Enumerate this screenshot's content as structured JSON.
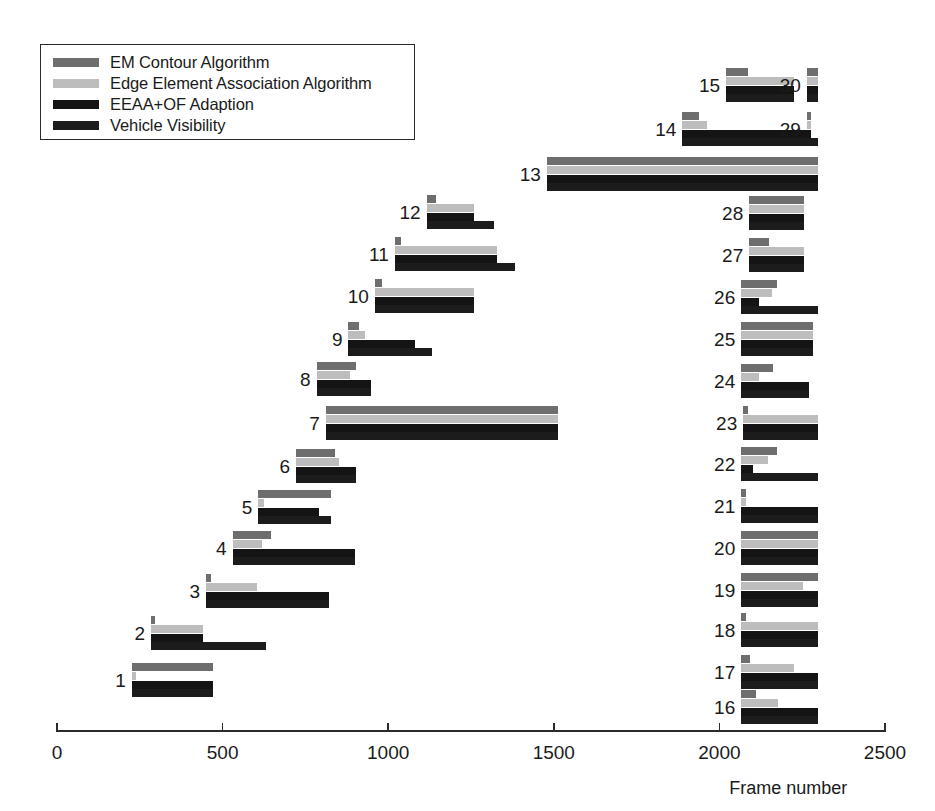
{
  "legend": {
    "items": [
      {
        "label": "EM Contour Algorithm",
        "color": "#6e6e6e"
      },
      {
        "label": "Edge Element Association Algorithm",
        "color": "#bdbdbd"
      },
      {
        "label": "EEAA+OF Adaption",
        "color": "#141414"
      },
      {
        "label": "Vehicle Visibility",
        "color": "#1c1c1c"
      }
    ]
  },
  "axis": {
    "label": "Frame number",
    "ticks": [
      0,
      500,
      1000,
      1500,
      2000,
      2500
    ],
    "tick_labels": [
      "0",
      "500",
      "1000",
      "1500",
      "2000",
      "2500"
    ],
    "min": 0,
    "max": 2500
  },
  "chart_data": {
    "type": "bar",
    "orientation": "horizontal",
    "title": "",
    "xlabel": "Frame number",
    "ylabel": "",
    "xlim": [
      0,
      2500
    ],
    "grid": false,
    "legend_position": "top-left",
    "note": "Gantt-style chart: each numbered track shows 4 stacked interval bars sharing a common start frame, one per algorithm series.",
    "series_names": [
      "EM Contour Algorithm",
      "Edge Element Association Algorithm",
      "EEAA+OF Adaption",
      "Vehicle Visibility"
    ],
    "series_colors": [
      "#6e6e6e",
      "#bdbdbd",
      "#141414",
      "#1c1c1c"
    ],
    "categories": [
      "1",
      "2",
      "3",
      "4",
      "5",
      "6",
      "7",
      "8",
      "9",
      "10",
      "11",
      "12",
      "13",
      "14",
      "15",
      "16",
      "17",
      "18",
      "19",
      "20",
      "21",
      "22",
      "23",
      "24",
      "25",
      "26",
      "27",
      "28",
      "29",
      "30"
    ],
    "tracks": [
      {
        "id": "1",
        "start": 226,
        "ends": [
          471,
          239,
          471,
          471
        ]
      },
      {
        "id": "2",
        "start": 284,
        "ends": [
          296,
          441,
          441,
          632
        ]
      },
      {
        "id": "3",
        "start": 450,
        "ends": [
          466,
          605,
          822,
          822
        ]
      },
      {
        "id": "4",
        "start": 530,
        "ends": [
          645,
          620,
          900,
          900
        ]
      },
      {
        "id": "5",
        "start": 608,
        "ends": [
          826,
          626,
          790,
          826
        ]
      },
      {
        "id": "6",
        "start": 722,
        "ends": [
          838,
          850,
          903,
          903
        ]
      },
      {
        "id": "7",
        "start": 812,
        "ends": [
          1513,
          1513,
          1513,
          1513
        ]
      },
      {
        "id": "8",
        "start": 784,
        "ends": [
          904,
          886,
          949,
          949
        ]
      },
      {
        "id": "9",
        "start": 880,
        "ends": [
          912,
          930,
          1081,
          1133
        ]
      },
      {
        "id": "10",
        "start": 960,
        "ends": [
          980,
          1258,
          1258,
          1258
        ]
      },
      {
        "id": "11",
        "start": 1020,
        "ends": [
          1040,
          1330,
          1330,
          1384
        ]
      },
      {
        "id": "12",
        "start": 1116,
        "ends": [
          1145,
          1260,
          1260,
          1320
        ]
      },
      {
        "id": "13",
        "start": 1479,
        "ends": [
          2298,
          2298,
          2298,
          2298
        ]
      },
      {
        "id": "14",
        "start": 1888,
        "ends": [
          1938,
          1964,
          2264,
          2264
        ]
      },
      {
        "id": "15",
        "start": 2020,
        "ends": [
          2085,
          2226,
          2226,
          2226
        ]
      },
      {
        "id": "16",
        "start": 2066,
        "ends": [
          2110,
          2178,
          2298,
          2298
        ]
      },
      {
        "id": "17",
        "start": 2066,
        "ends": [
          2093,
          2226,
          2298,
          2298
        ]
      },
      {
        "id": "18",
        "start": 2066,
        "ends": [
          2081,
          2298,
          2298,
          2298
        ]
      },
      {
        "id": "19",
        "start": 2066,
        "ends": [
          2298,
          2253,
          2298,
          2298
        ]
      },
      {
        "id": "20",
        "start": 2066,
        "ends": [
          2298,
          2298,
          2298,
          2298
        ]
      },
      {
        "id": "21",
        "start": 2066,
        "ends": [
          2081,
          2081,
          2298,
          2298
        ]
      },
      {
        "id": "22",
        "start": 2066,
        "ends": [
          2175,
          2148,
          2100,
          2298
        ]
      },
      {
        "id": "23",
        "start": 2072,
        "ends": [
          2087,
          2298,
          2298,
          2298
        ]
      },
      {
        "id": "24",
        "start": 2066,
        "ends": [
          2163,
          2120,
          2270,
          2270
        ]
      },
      {
        "id": "25",
        "start": 2066,
        "ends": [
          2283,
          2283,
          2283,
          2283
        ]
      },
      {
        "id": "26",
        "start": 2066,
        "ends": [
          2175,
          2160,
          2120,
          2298
        ]
      },
      {
        "id": "27",
        "start": 2090,
        "ends": [
          2150,
          2256,
          2256,
          2256
        ]
      },
      {
        "id": "28",
        "start": 2090,
        "ends": [
          2256,
          2256,
          2256,
          2256
        ]
      },
      {
        "id": "29",
        "start": 2264,
        "ends": [
          2276,
          2276,
          2276,
          2298
        ]
      },
      {
        "id": "30",
        "start": 2264,
        "ends": [
          2298,
          2298,
          2298,
          2298
        ]
      }
    ],
    "row_pixel_tops": [
      663,
      616,
      574,
      531,
      490,
      449,
      406,
      362,
      322,
      279,
      237,
      195,
      157,
      112,
      68,
      690,
      655,
      613,
      573,
      531,
      489,
      447,
      406,
      364,
      322,
      280,
      238,
      196,
      112,
      68
    ]
  }
}
